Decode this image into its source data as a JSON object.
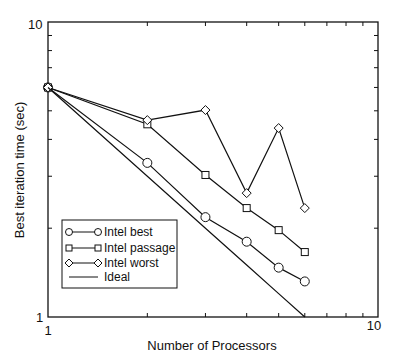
{
  "chart_data": {
    "type": "line",
    "title": "",
    "xlabel": "Number of Processors",
    "ylabel": "Best iteration time (sec)",
    "xscale": "log",
    "yscale": "log",
    "xlim": [
      1,
      10
    ],
    "ylim": [
      1,
      10
    ],
    "x_tick_labels": [
      "1",
      "10"
    ],
    "y_tick_labels": [
      "1",
      "10"
    ],
    "grid": false,
    "legend_position": "lower left",
    "x": [
      1,
      2,
      3,
      4,
      5,
      6
    ],
    "series": [
      {
        "name": "Intel best",
        "marker": "circle",
        "values": [
          6.0,
          3.33,
          2.18,
          1.8,
          1.47,
          1.32
        ]
      },
      {
        "name": "Intel passage",
        "marker": "square",
        "values": [
          6.0,
          4.5,
          3.03,
          2.34,
          1.97,
          1.66
        ]
      },
      {
        "name": "Intel worst",
        "marker": "diamond",
        "values": [
          6.0,
          4.65,
          5.03,
          2.63,
          4.37,
          2.34
        ]
      },
      {
        "name": "Ideal",
        "marker": "none",
        "values": [
          6.0,
          3.0,
          2.0,
          1.5,
          1.2,
          1.0
        ]
      }
    ]
  },
  "axes": {
    "xlabel": "Number of Processors",
    "ylabel": "Best iteration time (sec)",
    "x_min_label": "1",
    "x_max_label": "10",
    "y_min_label": "1",
    "y_max_label": "10"
  },
  "legend": {
    "items": [
      "Intel best",
      "Intel passage",
      "Intel worst",
      "Ideal"
    ]
  }
}
